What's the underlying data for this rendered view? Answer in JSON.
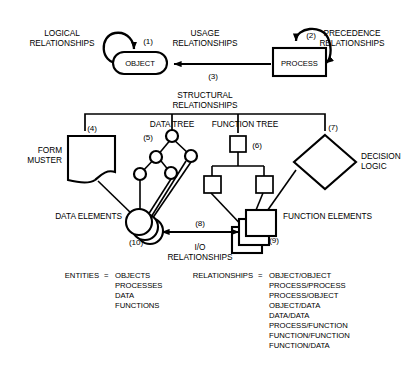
{
  "figure": {
    "top_row": {
      "logical_relationships": [
        "LOGICAL",
        "RELATIONSHIPS"
      ],
      "usage_relationships": [
        "USAGE",
        "RELATIONSHIPS"
      ],
      "precedence_relationships": [
        "PRECEDENCE",
        "RELATIONSHIPS"
      ],
      "object_label": "OBJECT",
      "process_label": "PROCESS",
      "marker_1": "(1)",
      "marker_2": "(2)",
      "marker_3": "(3)"
    },
    "structural": {
      "title": [
        "STRUCTURAL",
        "RELATIONSHIPS"
      ],
      "form_muster": [
        "FORM",
        "MUSTER"
      ],
      "data_tree": "DATA TREE",
      "function_tree": "FUNCTION TREE",
      "decision_logic": [
        "DECISION",
        "LOGIC"
      ],
      "marker_4": "(4)",
      "marker_5": "(5)",
      "marker_6": "(6)",
      "marker_7": "(7)"
    },
    "elements_row": {
      "data_elements": "DATA ELEMENTS",
      "function_elements": "FUNCTION ELEMENTS",
      "io_relationships": [
        "I/O",
        "RELATIONSHIPS"
      ],
      "marker_8": "(8)",
      "marker_9": "(9)",
      "marker_10": "(10)"
    },
    "legend": {
      "entities_key": "ENTITIES",
      "equals": "=",
      "entities_values": [
        "OBJECTS",
        "PROCESSES",
        "DATA",
        "FUNCTIONS"
      ],
      "relationships_key": "RELATIONSHIPS",
      "relationships_values": [
        "OBJECT/OBJECT",
        "PROCESS/PROCESS",
        "PROCESS/OBJECT",
        "OBJECT/DATA",
        "DATA/DATA",
        "PROCESS/FUNCTION",
        "FUNCTION/FUNCTION",
        "FUNCTION/DATA"
      ]
    },
    "colors": {
      "ink": "#000000",
      "paper": "#ffffff"
    }
  }
}
